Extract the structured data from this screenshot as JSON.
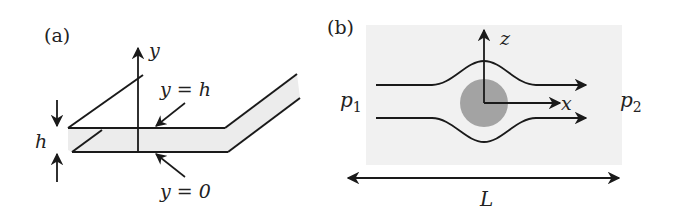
{
  "panels": {
    "a": {
      "label": "(a)",
      "axis_label": "y",
      "top_wall_label": "y = h",
      "bottom_wall_label": "y = 0",
      "gap_label": "h"
    },
    "b": {
      "label": "(b)",
      "z_axis_label": "z",
      "x_axis_label": "x",
      "inlet_pressure": {
        "symbol": "p",
        "sub": "1"
      },
      "outlet_pressure": {
        "symbol": "p",
        "sub": "2"
      },
      "length_label": "L"
    }
  },
  "colors": {
    "stroke": "#1a1a1a",
    "channel_fill": "#ececec",
    "domain_fill": "#f1f1f1",
    "obstacle_fill": "#a3a3a3"
  }
}
